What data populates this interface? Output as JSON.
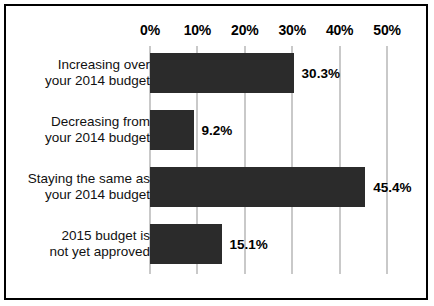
{
  "chart_data": {
    "type": "bar",
    "orientation": "horizontal",
    "title": "",
    "xlabel": "",
    "ylabel": "",
    "xlim": [
      0,
      50
    ],
    "grid": true,
    "legend": false,
    "tick_labels": [
      "0%",
      "10%",
      "20%",
      "30%",
      "40%",
      "50%"
    ],
    "ticks": [
      0,
      10,
      20,
      30,
      40,
      50
    ],
    "categories": [
      "Increasing over your 2014 budget",
      "Decreasing from your 2014 budget",
      "Staying the same as your 2014 budget",
      "2015 budget is not yet approved"
    ],
    "category_lines": [
      [
        "Increasing over",
        "your 2014 budget"
      ],
      [
        "Decreasing from",
        "your 2014 budget"
      ],
      [
        "Staying the same as",
        "your 2014 budget"
      ],
      [
        "2015 budget is",
        "not yet approved"
      ]
    ],
    "values": [
      30.3,
      9.2,
      45.4,
      15.1
    ],
    "value_labels": [
      "30.3%",
      "9.2%",
      "45.4%",
      "15.1%"
    ],
    "colors": {
      "bar": "#2b2b2b",
      "gridline": "#c9c9c9",
      "background": "#ffffff",
      "border": "#000000",
      "text": "#000000"
    }
  }
}
